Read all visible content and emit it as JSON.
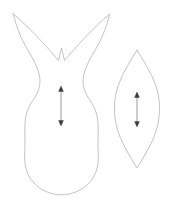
{
  "canvas": {
    "width": 171,
    "height": 202,
    "background_color": "#ffffff",
    "outline_color": "#a9a9ad",
    "grainline_color": "#3a3a3e"
  },
  "pieces": [
    {
      "id": "tulip-body",
      "name": "tulip-petal-piece",
      "description": "Tulip / vase silhouette with two pointed top tips and a V notch, narrow waist and rounded bottom",
      "bounds": {
        "x": 12,
        "y": 13,
        "width": 98,
        "height": 182
      },
      "path": "M 13.5 14.5 C 18 33 27 49 39 61 C 47 69 54 75 60.5 80 C 67 75 74 69 82 61 C 94 49 103.5 33 108.5 14.5 C 101 22 92 31 85 39 C 76 49 68 57 61.5 49.5 C 55 42 47 33 39 24.5 C 31 20 22 16.5 13.5 14.5 Z",
      "outline_points_note": "left tip (13,14), right tip (109,14), notch bottom (61,49)",
      "grainline": {
        "name": "grainline-arrow-tulip",
        "x": 61,
        "y_top": 86,
        "y_bottom": 126,
        "double_headed": true
      }
    },
    {
      "id": "leaf-body",
      "name": "leaf-piece",
      "description": "Pointed lens / leaf shape with tips at top and bottom",
      "bounds": {
        "x": 114,
        "y": 50,
        "width": 46,
        "height": 118
      },
      "tip_top": {
        "x": 137,
        "y": 50
      },
      "tip_bottom": {
        "x": 137,
        "y": 168
      },
      "widest": {
        "left_x": 114.5,
        "right_x": 159.5,
        "y": 110
      },
      "grainline": {
        "name": "grainline-arrow-leaf",
        "x": 137,
        "y_top": 92,
        "y_bottom": 127,
        "double_headed": true
      }
    }
  ]
}
